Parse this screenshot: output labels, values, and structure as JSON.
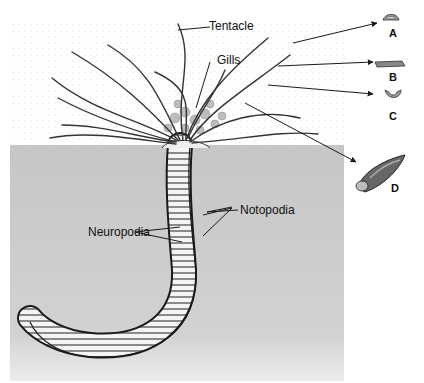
{
  "diagram": {
    "colors": {
      "sediment": "#c9c9c9",
      "water_stipple": "#cfcfcf",
      "outline": "#1a1a1a",
      "body_fill": "#f4f4f4",
      "gill_fill": "#bdbdbd"
    },
    "labels": {
      "tentacle": "Tentacle",
      "gills": "Gills",
      "notopodia": "Notopodia",
      "neuropodia": "Neuropodia"
    },
    "insets": [
      {
        "letter": "A",
        "shape": "dome cross-section"
      },
      {
        "letter": "B",
        "shape": "flat grooved cross-section"
      },
      {
        "letter": "C",
        "shape": "U-shaped cross-section"
      },
      {
        "letter": "D",
        "shape": "tentacle tip with groove"
      }
    ]
  }
}
